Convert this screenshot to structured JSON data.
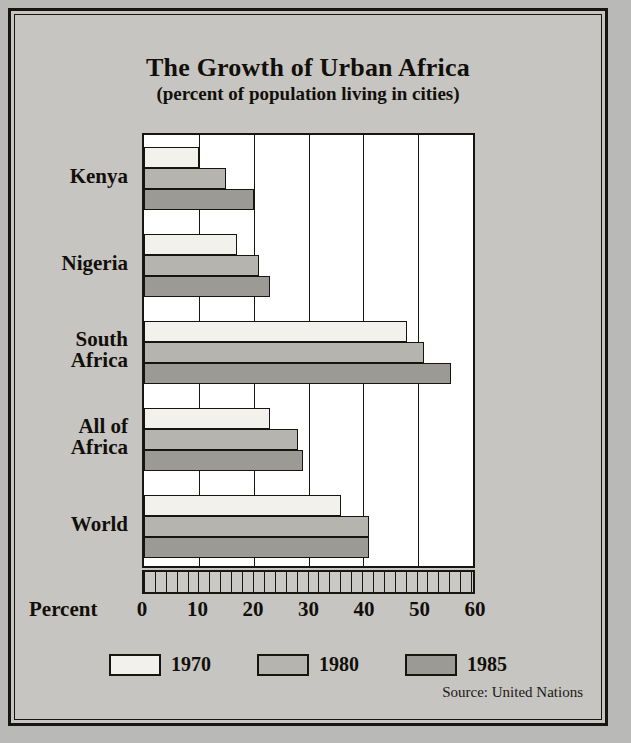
{
  "chart_data": {
    "type": "bar",
    "orientation": "horizontal",
    "title": "The Growth of Urban Africa",
    "subtitle": "(percent of population living in cities)",
    "xlabel": "Percent",
    "ylabel": "",
    "xlim": [
      0,
      60
    ],
    "xticks": [
      0,
      10,
      20,
      30,
      40,
      50,
      60
    ],
    "minor_tick_step": 2,
    "grid": true,
    "legend_position": "bottom",
    "source": "Source: United Nations",
    "categories": [
      "Kenya",
      "Nigeria",
      "South\nAfrica",
      "All of\nAfrica",
      "World"
    ],
    "series": [
      {
        "name": "1970",
        "color": "#f2f1ec",
        "values": [
          10,
          17,
          48,
          23,
          36
        ]
      },
      {
        "name": "1980",
        "color": "#b5b4ae",
        "values": [
          15,
          21,
          51,
          28,
          41
        ]
      },
      {
        "name": "1985",
        "color": "#9b9a94",
        "values": [
          20,
          23,
          56,
          29,
          41
        ]
      }
    ]
  },
  "colors": {
    "page_background": "#b9b9b7",
    "panel_background": "#c6c5c1",
    "plot_background": "#ffffff",
    "ink": "#17150f",
    "ruler_fill": "#c9c8c4"
  }
}
